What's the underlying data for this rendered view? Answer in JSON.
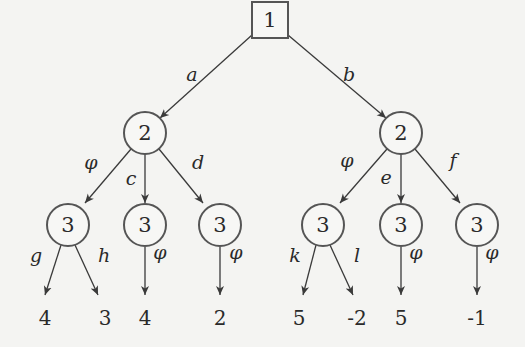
{
  "diagram": {
    "type": "game-tree",
    "nodes": [
      {
        "id": "root",
        "player": "1",
        "shape": "square",
        "x": 270,
        "y": 20
      },
      {
        "id": "n2L",
        "player": "2",
        "shape": "circle",
        "x": 145,
        "y": 133
      },
      {
        "id": "n2R",
        "player": "2",
        "shape": "circle",
        "x": 401,
        "y": 133
      },
      {
        "id": "n3a",
        "player": "3",
        "shape": "circle",
        "x": 68,
        "y": 225
      },
      {
        "id": "n3b",
        "player": "3",
        "shape": "circle",
        "x": 145,
        "y": 225
      },
      {
        "id": "n3c",
        "player": "3",
        "shape": "circle",
        "x": 220,
        "y": 225
      },
      {
        "id": "n3d",
        "player": "3",
        "shape": "circle",
        "x": 323,
        "y": 225
      },
      {
        "id": "n3e",
        "player": "3",
        "shape": "circle",
        "x": 401,
        "y": 225
      },
      {
        "id": "n3f",
        "player": "3",
        "shape": "circle",
        "x": 477,
        "y": 225
      }
    ],
    "edges": [
      {
        "from": "root",
        "to": "n2L",
        "label": "a"
      },
      {
        "from": "root",
        "to": "n2R",
        "label": "b"
      },
      {
        "from": "n2L",
        "to": "n3a",
        "label": "φ"
      },
      {
        "from": "n2L",
        "to": "n3b",
        "label": "c"
      },
      {
        "from": "n2L",
        "to": "n3c",
        "label": "d"
      },
      {
        "from": "n2R",
        "to": "n3d",
        "label": "φ"
      },
      {
        "from": "n2R",
        "to": "n3e",
        "label": "e"
      },
      {
        "from": "n2R",
        "to": "n3f",
        "label": "f"
      },
      {
        "from": "n3a",
        "to": "leaf1",
        "label": "g"
      },
      {
        "from": "n3a",
        "to": "leaf2",
        "label": "h"
      },
      {
        "from": "n3b",
        "to": "leaf3",
        "label": "φ"
      },
      {
        "from": "n3c",
        "to": "leaf4",
        "label": "φ"
      },
      {
        "from": "n3d",
        "to": "leaf5",
        "label": "k"
      },
      {
        "from": "n3d",
        "to": "leaf6",
        "label": "l"
      },
      {
        "from": "n3e",
        "to": "leaf7",
        "label": "φ"
      },
      {
        "from": "n3f",
        "to": "leaf8",
        "label": "φ"
      }
    ],
    "leaves": [
      {
        "id": "leaf1",
        "payoff": "4",
        "x": 45,
        "y": 318
      },
      {
        "id": "leaf2",
        "payoff": "3",
        "x": 105,
        "y": 318
      },
      {
        "id": "leaf3",
        "payoff": "4",
        "x": 145,
        "y": 318
      },
      {
        "id": "leaf4",
        "payoff": "2",
        "x": 220,
        "y": 318
      },
      {
        "id": "leaf5",
        "payoff": "5",
        "x": 299,
        "y": 318
      },
      {
        "id": "leaf6",
        "payoff": "-2",
        "x": 357,
        "y": 318
      },
      {
        "id": "leaf7",
        "payoff": "5",
        "x": 401,
        "y": 318
      },
      {
        "id": "leaf8",
        "payoff": "-1",
        "x": 477,
        "y": 318
      }
    ]
  }
}
